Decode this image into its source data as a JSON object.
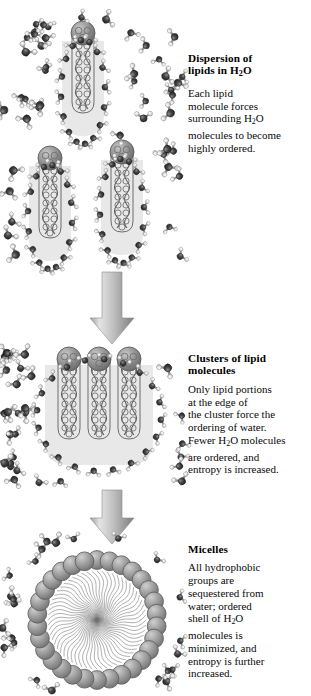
{
  "figure": {
    "type": "scientific-diagram",
    "background_color": "#ffffff"
  },
  "palette": {
    "lipid_head": "#8f8f8f",
    "lipid_head_dark": "#6e6e6e",
    "lipid_head_light": "#c3c3c3",
    "lipid_tail_line": "#5a5a5a",
    "ordered_water_shell": "#e6e6e6",
    "water_oxygen": "#3a3a3a",
    "water_hydrogen": "#e2e2e2",
    "water_bond": "#8a8a8a",
    "arrow_fill_light": "#d6d6d6",
    "arrow_fill_dark": "#8a8a8a",
    "text": "#000000"
  },
  "panels": [
    {
      "id": "dispersion",
      "heading_lines": [
        "Dispersion of",
        "lipids in H2O"
      ],
      "heading_plain": "Dispersion of lipids in H₂O",
      "body_lines": [
        "Each lipid",
        "molecule forces",
        "surrounding H2O",
        "molecules to become",
        "highly ordered."
      ],
      "body_plain": "Each lipid molecule forces surrounding H₂O molecules to become highly ordered.",
      "lipid_count": 3,
      "water_shell": "individual shell around each lipid"
    },
    {
      "id": "clusters",
      "heading_lines": [
        "Clusters of lipid",
        "molecules"
      ],
      "heading_plain": "Clusters of lipid molecules",
      "body_lines": [
        "Only lipid portions",
        "at the edge of",
        "the cluster force the",
        "ordering of water.",
        "Fewer H2O molecules",
        "are ordered, and",
        "entropy is increased."
      ],
      "body_plain": "Only lipid portions at the edge of the cluster force the ordering of water. Fewer H₂O molecules are ordered, and entropy is increased.",
      "lipid_count": 3,
      "water_shell": "single shared shell around the cluster"
    },
    {
      "id": "micelles",
      "heading_lines": [
        "Micelles"
      ],
      "heading_plain": "Micelles",
      "body_lines": [
        "All hydrophobic",
        "groups are",
        "sequestered from",
        "water;  ordered",
        "shell of H2O",
        "molecules is",
        "minimized, and",
        "entropy is further",
        "increased."
      ],
      "body_plain": "All hydrophobic groups are sequestered from water; ordered shell of H₂O molecules is minimized, and entropy is further increased.",
      "lipid_count": 30,
      "water_shell": "none — minimized ordered shell"
    }
  ],
  "arrows": [
    {
      "id": "arrow-dispersion-to-clusters",
      "direction": "down"
    },
    {
      "id": "arrow-clusters-to-micelles",
      "direction": "down"
    }
  ],
  "subscript": {
    "two": "2"
  }
}
